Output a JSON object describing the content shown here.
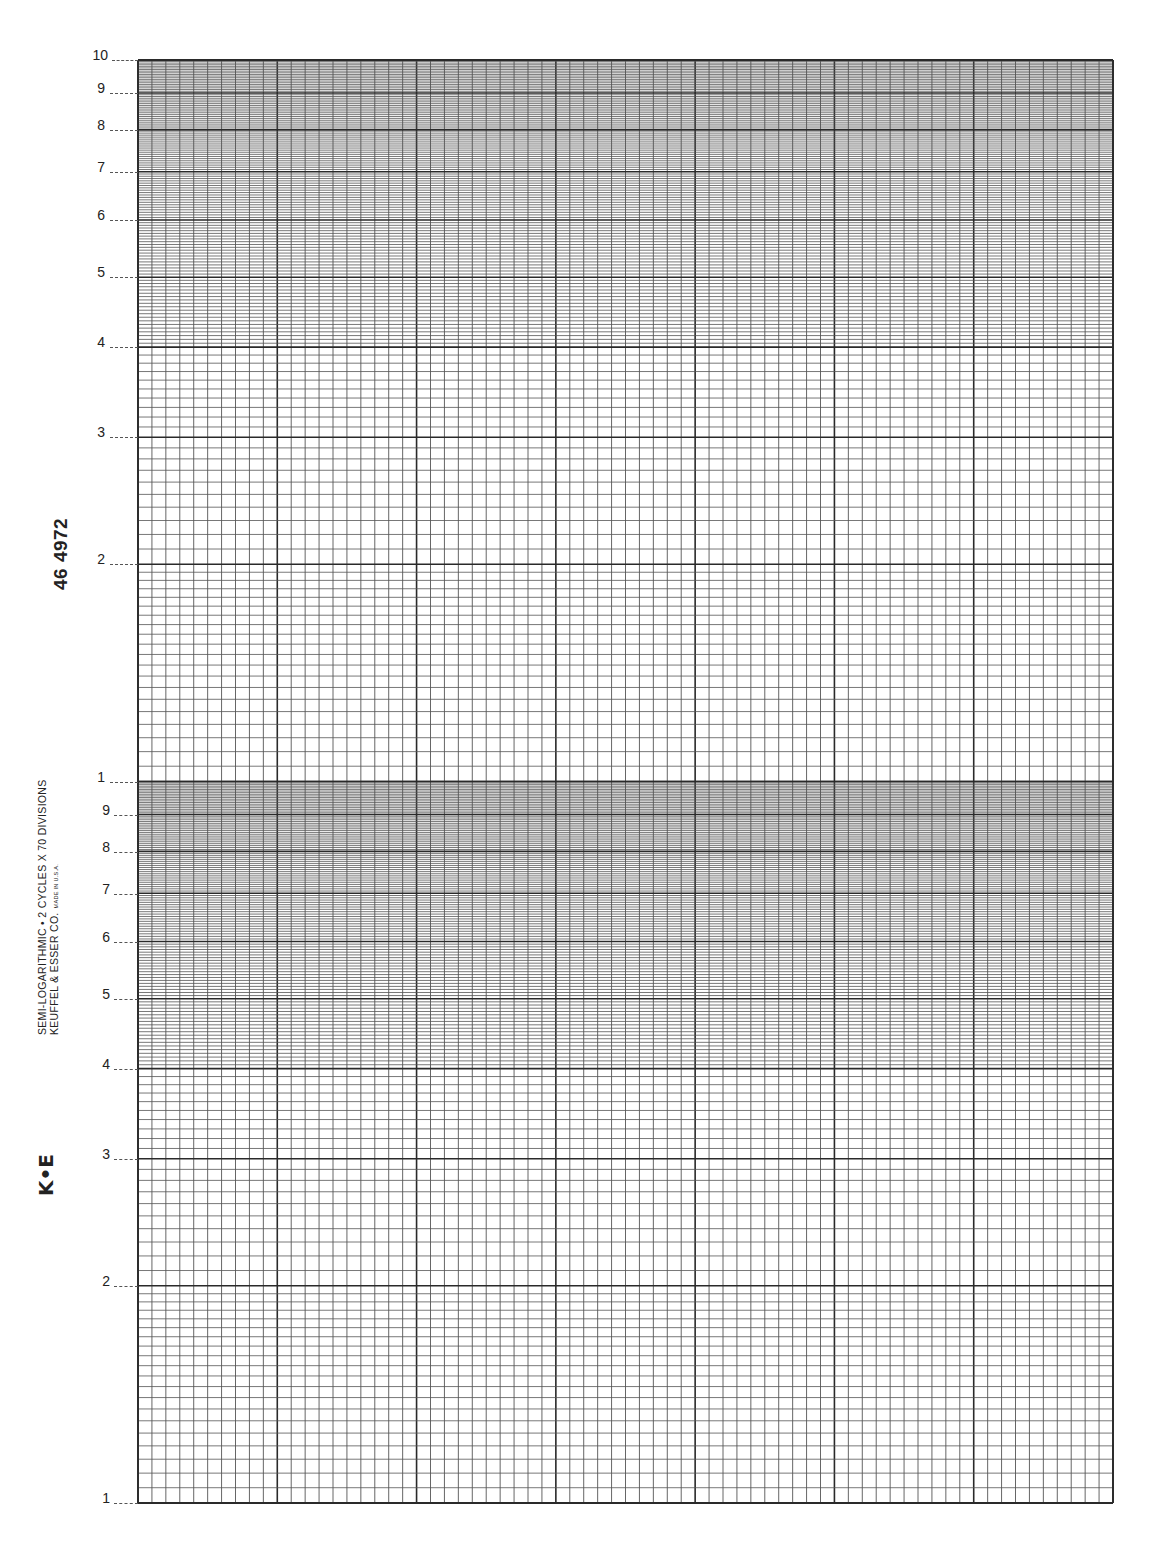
{
  "paper": {
    "type": "semi-logarithmic graph paper",
    "catalog_number": "46 4972",
    "title_line": "SEMI-LOGARITHMIC • 2 CYCLES X 70 DIVISIONS",
    "maker_line": "KEUFFEL & ESSER CO.",
    "made_in": "MADE IN U.S.A.",
    "logo": "K•E",
    "cycles": 2,
    "divisions": 70
  },
  "grid": {
    "left": 138,
    "right": 1113,
    "top": 60,
    "bottom": 1503,
    "line_color": "#2a2a2a",
    "minor_color": "#555555"
  },
  "y_axis_labels": [
    {
      "text": "10",
      "y": 60
    },
    {
      "text": "9",
      "y": 93
    },
    {
      "text": "8",
      "y": 130
    },
    {
      "text": "7",
      "y": 172
    },
    {
      "text": "6",
      "y": 220
    },
    {
      "text": "5",
      "y": 277
    },
    {
      "text": "4",
      "y": 347
    },
    {
      "text": "3",
      "y": 437
    },
    {
      "text": "2",
      "y": 564
    },
    {
      "text": "1",
      "y": 782
    },
    {
      "text": "9",
      "y": 815
    },
    {
      "text": "8",
      "y": 852
    },
    {
      "text": "7",
      "y": 894
    },
    {
      "text": "6",
      "y": 942
    },
    {
      "text": "5",
      "y": 999
    },
    {
      "text": "4",
      "y": 1069
    },
    {
      "text": "3",
      "y": 1159
    },
    {
      "text": "2",
      "y": 1286
    },
    {
      "text": "1",
      "y": 1503
    }
  ]
}
